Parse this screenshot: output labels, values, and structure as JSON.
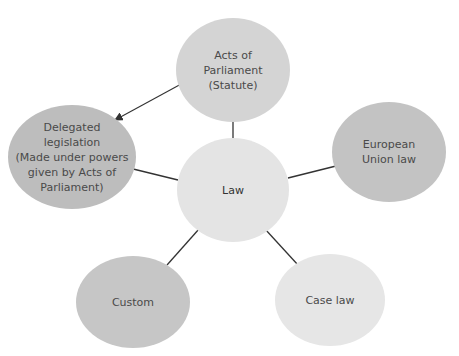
{
  "diagram": {
    "center": {
      "label": "Law",
      "color": "#e4e4e4"
    },
    "nodes": [
      {
        "id": "acts",
        "label": "Acts of\nParliament\n(Statute)",
        "color": "#d4d4d4"
      },
      {
        "id": "delegated",
        "label": "Delegated\nlegislation\n(Made under powers\ngiven by Acts of\nParliament)",
        "color": "#bdbdbd"
      },
      {
        "id": "eu",
        "label": "European\nUnion law",
        "color": "#c3c3c3"
      },
      {
        "id": "custom",
        "label": "Custom",
        "color": "#c6c6c6"
      },
      {
        "id": "caselaw",
        "label": "Case law",
        "color": "#e6e6e6"
      }
    ],
    "edges": [
      {
        "from": "acts",
        "to": "delegated",
        "type": "arrow"
      },
      {
        "from": "law",
        "to": "acts",
        "type": "line"
      },
      {
        "from": "law",
        "to": "delegated",
        "type": "line"
      },
      {
        "from": "law",
        "to": "eu",
        "type": "line"
      },
      {
        "from": "law",
        "to": "custom",
        "type": "line"
      },
      {
        "from": "law",
        "to": "caselaw",
        "type": "line"
      }
    ]
  }
}
